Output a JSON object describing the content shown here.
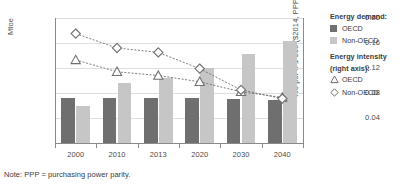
{
  "note": "Note: PPP = purchasing power parity.",
  "legend": {
    "demand_title": "Energy demand:",
    "intensity_title_line1": "Energy intensity",
    "intensity_title_line2": "(right axis):",
    "demand_oecd": "OECD",
    "demand_nonoecd": "Non-OECD",
    "intensity_oecd": "OECD",
    "intensity_nonoecd": "Non-OECD"
  },
  "colors": {
    "bar_oecd": "#6f6f6f",
    "bar_nonoecd": "#c6c6c6",
    "marker_stroke": "#6f6f6f",
    "marker_fill": "#ffffff",
    "gridline": "#dedede",
    "axis": "#8a8a8a",
    "text": "#3a3a3a"
  },
  "chart_data": {
    "type": "bar",
    "title": "",
    "xlabel": "",
    "ylabel": "Mtoe",
    "ylabel_right": "toe per $ 1 000 ($2014, PPP)",
    "categories": [
      "2000",
      "2010",
      "2013",
      "2020",
      "2030",
      "2040"
    ],
    "ylim": [
      0,
      15000
    ],
    "yticks": [
      3000,
      6000,
      9000,
      12000,
      15000
    ],
    "ytick_labels": [
      "3 000",
      "6 000",
      "9 000",
      "12 000",
      "15 000"
    ],
    "ylim_right": [
      0,
      0.2
    ],
    "yticks_right": [
      0.04,
      0.08,
      0.12,
      0.16,
      0.2
    ],
    "ytick_labels_right": [
      "0.04",
      "0.08",
      "0.12",
      "0.16",
      "0.20"
    ],
    "grid": true,
    "legend_position": "right",
    "series": [
      {
        "name": "Energy demand: OECD",
        "kind": "bar",
        "axis": "left",
        "unit": "Mtoe",
        "color": "#6f6f6f",
        "values": [
          5350,
          5450,
          5350,
          5350,
          5300,
          5200
        ]
      },
      {
        "name": "Energy demand: Non-OECD",
        "kind": "bar",
        "axis": "left",
        "unit": "Mtoe",
        "color": "#c6c6c6",
        "values": [
          4500,
          7150,
          7800,
          9050,
          10700,
          12300
        ]
      },
      {
        "name": "Energy intensity: OECD",
        "kind": "line",
        "marker": "triangle",
        "axis": "right",
        "unit": "toe per $ 1 000 ($2014, PPP)",
        "values": [
          0.133,
          0.114,
          0.108,
          0.098,
          0.082,
          0.073
        ]
      },
      {
        "name": "Energy intensity: Non-OECD",
        "kind": "line",
        "marker": "diamond",
        "axis": "right",
        "unit": "toe per $ 1 000 ($2014, PPP)",
        "values": [
          0.175,
          0.152,
          0.145,
          0.119,
          0.085,
          0.071
        ]
      }
    ]
  }
}
